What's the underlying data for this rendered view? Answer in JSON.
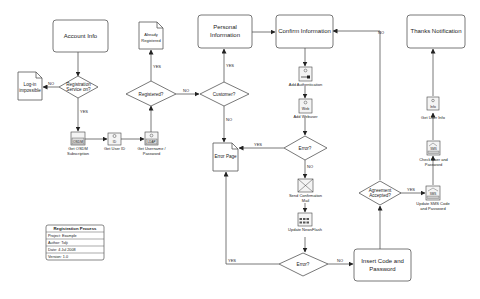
{
  "diagram": {
    "type": "flowchart",
    "title": "Registration Process",
    "processes": {
      "account_info": "Account Info",
      "personal_information": [
        "Personal",
        "Information"
      ],
      "confirm_information": "Confirm Information",
      "thanks_notification": "Thanks Notification",
      "insert_code": [
        "Insert Code and",
        "Password"
      ]
    },
    "decisions": {
      "registration_service": [
        "Registration",
        "Service on?"
      ],
      "registered": "Registered?",
      "customer": "Customer?",
      "error_top": "Error?",
      "error_bottom": "Error?",
      "agreement": [
        "Agreement",
        "Accepted?"
      ]
    },
    "documents": {
      "login_impossible": [
        "Log-in",
        "impossible"
      ],
      "already_registered": [
        "Already",
        "Registered"
      ],
      "error_page": "Error Page"
    },
    "tasks": {
      "get_osdm": {
        "label": [
          "Get OSDM",
          "Subscription"
        ],
        "icon_text": "OSDM"
      },
      "get_user_id": {
        "label": [
          "Get User ID"
        ],
        "icon_text": "ID"
      },
      "get_username": {
        "label": [
          "Get Username /",
          "Password"
        ],
        "icon_text": "LDAP"
      },
      "add_auth": {
        "label": [
          "Add Authentication"
        ],
        "icon_text": "key"
      },
      "add_webuser": {
        "label": [
          "Add Webuser"
        ],
        "icon_text": "Web"
      },
      "send_mail": {
        "label": [
          "Send Confirmation",
          "Mail"
        ],
        "icon_text": ""
      },
      "update_newsflash": {
        "label": [
          "Update NewsFlash"
        ],
        "icon_text": ""
      },
      "get_user_info": {
        "label": [
          "Get User Info"
        ],
        "icon_text": "Info"
      },
      "check_user": {
        "label": [
          "Check User and",
          "Password"
        ],
        "icon_text": "SMS"
      },
      "update_sms": {
        "label": [
          "Update SMS Code",
          "and Password"
        ],
        "icon_text": "SMS"
      }
    },
    "edge_labels": {
      "yes": "YES",
      "no": "NO"
    },
    "legend": {
      "title": "Registration Process",
      "rows": [
        "Project:  Example",
        "Author:  Tolji",
        "Date:  4 Jul 2008",
        "Version:  1.0"
      ]
    }
  }
}
